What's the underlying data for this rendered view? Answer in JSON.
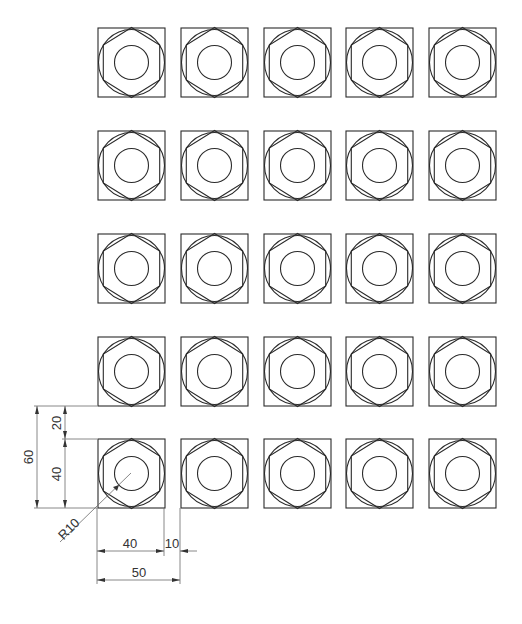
{
  "drawing": {
    "title": "Hex nut array drawing",
    "grid": {
      "rows": 5,
      "cols": 5,
      "col_x": [
        98,
        181,
        264,
        346,
        429
      ],
      "row_y": [
        28,
        131,
        234,
        337,
        439
      ],
      "square_size": 67,
      "outer_circle_r": 33,
      "inner_circle_r": 17
    },
    "line_color": "#2a2a2a",
    "dimension_color": "#6a6a6a",
    "dimensions": {
      "overall_height": "60",
      "gap_height": "20",
      "square_height": "40",
      "square_width": "40",
      "gap_width": "10",
      "overall_width": "50",
      "hole_radius": "R10"
    }
  }
}
